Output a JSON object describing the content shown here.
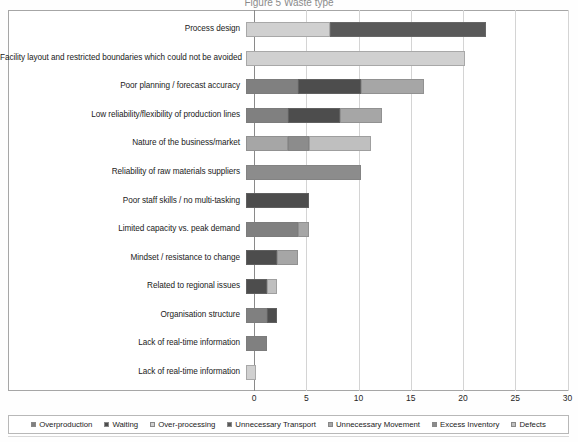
{
  "title": "Figure 5 Waste type",
  "chart_data": {
    "type": "bar",
    "orientation": "horizontal",
    "stacked": true,
    "title": "Figure 5 Waste type",
    "xlabel": "",
    "ylabel": "",
    "xlim": [
      0,
      30
    ],
    "xticks": [
      0,
      5,
      10,
      15,
      20,
      25,
      30
    ],
    "grid": true,
    "legend_position": "bottom",
    "categories": [
      "Process design",
      "Facility layout and restricted boundaries which could not be avoided",
      "Poor planning / forecast accuracy",
      "Low reliability/flexibility of production lines",
      "Nature of the business/market",
      "Reliability of raw materials suppliers",
      "Poor staff skills / no multi-tasking",
      "Limited capacity vs. peak demand",
      "Mindset / resistance to change",
      "Related to regional issues",
      "Organisation structure",
      "Lack of real-time information",
      "Lack of real-time information"
    ],
    "series": [
      {
        "name": "Overproduction",
        "color": "#808080",
        "values": [
          0,
          0,
          5,
          4,
          0,
          0,
          0,
          5,
          0,
          0,
          2,
          2,
          0
        ]
      },
      {
        "name": "Waiting",
        "color": "#4d4d4d",
        "values": [
          0,
          0,
          6,
          5,
          0,
          0,
          6,
          0,
          3,
          2,
          1,
          0,
          0
        ]
      },
      {
        "name": "Over-processing",
        "color": "#d0d0d0",
        "values": [
          8,
          21,
          0,
          0,
          0,
          0,
          0,
          0,
          0,
          0,
          0,
          0,
          1
        ]
      },
      {
        "name": "Unnecessary Transport",
        "color": "#595959",
        "values": [
          15,
          0,
          0,
          0,
          0,
          0,
          0,
          0,
          0,
          0,
          0,
          0,
          0
        ]
      },
      {
        "name": "Unnecessary Movement",
        "color": "#a6a6a6",
        "values": [
          0,
          0,
          6,
          4,
          4,
          0,
          0,
          1,
          2,
          0,
          0,
          0,
          0
        ]
      },
      {
        "name": "Excess Inventory",
        "color": "#8c8c8c",
        "values": [
          0,
          0,
          0,
          0,
          2,
          11,
          0,
          0,
          0,
          0,
          0,
          0,
          0
        ]
      },
      {
        "name": "Defects",
        "color": "#bfbfbf",
        "values": [
          0,
          0,
          0,
          0,
          6,
          0,
          0,
          0,
          0,
          1,
          0,
          0,
          0
        ]
      }
    ],
    "totals": [
      23,
      21,
      17,
      13,
      12,
      11,
      6,
      6,
      5,
      3,
      3,
      2,
      1
    ]
  },
  "axis": {
    "xticks": [
      "0",
      "5",
      "10",
      "15",
      "20",
      "25",
      "30"
    ]
  },
  "legend": {
    "items": [
      {
        "label": "Overproduction",
        "color": "#808080"
      },
      {
        "label": "Waiting",
        "color": "#4d4d4d"
      },
      {
        "label": "Over-processing",
        "color": "#d0d0d0"
      },
      {
        "label": "Unnecessary Transport",
        "color": "#595959"
      },
      {
        "label": "Unnecessary Movement",
        "color": "#a6a6a6"
      },
      {
        "label": "Excess Inventory",
        "color": "#8c8c8c"
      },
      {
        "label": "Defects",
        "color": "#bfbfbf"
      }
    ]
  }
}
